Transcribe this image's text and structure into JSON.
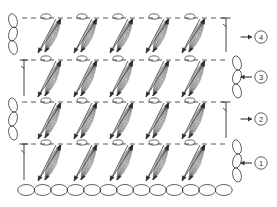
{
  "diagram": {
    "kind": "crochet-pattern-diagram",
    "background_color": "#ffffff",
    "stroke_color": "#2b2b2b",
    "light_stroke_color": "#4a4a4a",
    "marker_color": "#333333",
    "width": 277,
    "height": 207
  },
  "row_markers": [
    {
      "id": "row-4",
      "label": "4",
      "arrow": "→",
      "direction": "right",
      "cx": 261,
      "cy": 37
    },
    {
      "id": "row-3",
      "label": "3",
      "arrow": "←",
      "direction": "left",
      "cx": 261,
      "cy": 77
    },
    {
      "id": "row-2",
      "label": "2",
      "arrow": "→",
      "direction": "right",
      "cx": 261,
      "cy": 119
    },
    {
      "id": "row-1",
      "label": "1",
      "arrow": "←",
      "direction": "left",
      "cx": 261,
      "cy": 163
    }
  ],
  "rows": [
    {
      "id": "row-4",
      "number": 4,
      "top_y": 18,
      "bottom_y": 52,
      "left_x": 22,
      "right_x": 228,
      "direction": "right",
      "edge_side": "left",
      "edge_type": "chain-loops",
      "turning_chain_side": "right",
      "clusters": 5,
      "cluster_xs": [
        58,
        94,
        130,
        166,
        202
      ],
      "loop_xs": [
        46,
        82,
        118,
        154,
        190
      ],
      "dashed_top": false
    },
    {
      "id": "row-3",
      "number": 3,
      "top_y": 60,
      "bottom_y": 96,
      "left_x": 22,
      "right_x": 228,
      "direction": "left",
      "edge_side": "right",
      "edge_type": "chain-loops",
      "turning_chain_side": "left",
      "clusters": 5,
      "cluster_xs": [
        58,
        94,
        130,
        166,
        202
      ],
      "loop_xs": [
        46,
        82,
        118,
        154,
        190
      ],
      "dashed_top": true
    },
    {
      "id": "row-2",
      "number": 2,
      "top_y": 102,
      "bottom_y": 138,
      "left_x": 22,
      "right_x": 228,
      "direction": "right",
      "edge_side": "left",
      "edge_type": "chain-loops",
      "turning_chain_side": "right",
      "clusters": 5,
      "cluster_xs": [
        58,
        94,
        130,
        166,
        202
      ],
      "loop_xs": [
        46,
        82,
        118,
        154,
        190
      ],
      "dashed_top": true
    },
    {
      "id": "row-1",
      "number": 1,
      "top_y": 144,
      "bottom_y": 180,
      "left_x": 22,
      "right_x": 228,
      "direction": "left",
      "edge_side": "right",
      "edge_type": "chain-loops",
      "turning_chain_side": "left",
      "clusters": 5,
      "cluster_xs": [
        58,
        94,
        130,
        166,
        202
      ],
      "loop_xs": [
        46,
        82,
        118,
        154,
        190
      ],
      "dashed_top": true
    }
  ],
  "foundation_chain": {
    "id": "foundation-chain",
    "y": 190,
    "start_x": 18,
    "end_x": 232,
    "link_count": 13,
    "link_width": 17,
    "link_height": 11
  }
}
